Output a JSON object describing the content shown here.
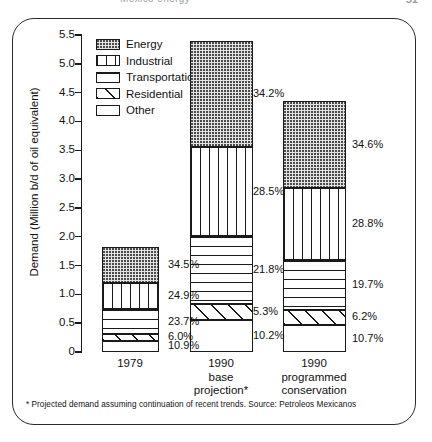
{
  "page": {
    "header_title": "Mexico energy",
    "page_number": "51"
  },
  "chart_data": {
    "type": "bar",
    "subtype": "stacked-percentage",
    "title": "",
    "xlabel": "",
    "ylabel": "Demand (Million b/d of oil equivalent)",
    "ylim": [
      0,
      5.5
    ],
    "ytick_labels": [
      "5.5",
      "5.0",
      "4.5",
      "4.0",
      "3.5",
      "3.0",
      "2.5",
      "2.0",
      "1.5",
      "1.0",
      "0.5",
      "0"
    ],
    "ytick_values": [
      5.5,
      5.0,
      4.5,
      4.0,
      3.5,
      3.0,
      2.5,
      2.0,
      1.5,
      1.0,
      0.5,
      0
    ],
    "grid": false,
    "legend_position": "upper-left-inside",
    "legend": [
      {
        "label": "Energy",
        "pattern": "dotted"
      },
      {
        "label": "Industrial",
        "pattern": "vertical-lines"
      },
      {
        "label": "Transportation",
        "pattern": "horizontal-lines"
      },
      {
        "label": "Residential",
        "pattern": "diagonal-lines"
      },
      {
        "label": "Other",
        "pattern": "blank"
      }
    ],
    "categories": [
      {
        "lines": [
          "1979"
        ]
      },
      {
        "lines": [
          "1990",
          "base",
          "projection*"
        ]
      },
      {
        "lines": [
          "1990",
          "programmed",
          "conservation"
        ]
      }
    ],
    "series": [
      {
        "name": "Energy",
        "percent": [
          34.5,
          34.2,
          34.6
        ]
      },
      {
        "name": "Industrial",
        "percent": [
          24.9,
          28.5,
          28.8
        ]
      },
      {
        "name": "Transportation",
        "percent": [
          23.7,
          21.8,
          19.7
        ]
      },
      {
        "name": "Residential",
        "percent": [
          6.0,
          5.3,
          6.2
        ]
      },
      {
        "name": "Other",
        "percent": [
          10.9,
          10.2,
          10.7
        ]
      }
    ],
    "totals": [
      1.82,
      5.4,
      4.35
    ],
    "bars": [
      {
        "category": "1979",
        "total": 1.82,
        "segments": [
          {
            "name": "Energy",
            "percent_label": "34.5%"
          },
          {
            "name": "Industrial",
            "percent_label": "24.9%"
          },
          {
            "name": "Transportation",
            "percent_label": "23.7%"
          },
          {
            "name": "Residential",
            "percent_label": "6.0%"
          },
          {
            "name": "Other",
            "percent_label": "10.9%"
          }
        ]
      },
      {
        "category": "1990 base projection*",
        "total": 5.4,
        "segments": [
          {
            "name": "Energy",
            "percent_label": "34.2%"
          },
          {
            "name": "Industrial",
            "percent_label": "28.5%"
          },
          {
            "name": "Transportation",
            "percent_label": "21.8%"
          },
          {
            "name": "Residential",
            "percent_label": "5.3%"
          },
          {
            "name": "Other",
            "percent_label": "10.2%"
          }
        ]
      },
      {
        "category": "1990 programmed conservation",
        "total": 4.35,
        "segments": [
          {
            "name": "Energy",
            "percent_label": "34.6%"
          },
          {
            "name": "Industrial",
            "percent_label": "28.8%"
          },
          {
            "name": "Transportation",
            "percent_label": "19.7%"
          },
          {
            "name": "Residential",
            "percent_label": "6.2%"
          },
          {
            "name": "Other",
            "percent_label": "10.7%"
          }
        ]
      }
    ],
    "footnote": "* Projected demand assuming continuation of recent trends. Source: Petroleos Mexicanos"
  }
}
